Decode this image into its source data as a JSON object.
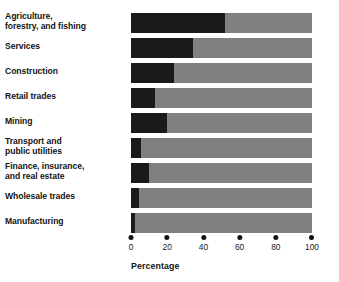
{
  "chart_data": {
    "type": "bar",
    "orientation": "horizontal",
    "stacked": true,
    "title": "",
    "subtitle": "",
    "xlabel": "Percentage",
    "ylabel": "",
    "xlim": [
      0,
      100
    ],
    "xticks": [
      0,
      20,
      40,
      60,
      80,
      100
    ],
    "xtick_labels": [
      "0",
      "20",
      "40",
      "60",
      "80",
      "100"
    ],
    "grid": false,
    "legend": "none",
    "colors": {
      "segment_dark": "#1a1a1a",
      "segment_gray": "#808080",
      "text": "#141414",
      "background": "#ffffff"
    },
    "categories": [
      "Agriculture,\nforestry, and fishing",
      "Services",
      "Construction",
      "Retail trades",
      "Mining",
      "Transport and\npublic utilities",
      "Finance, insurance,\nand real estate",
      "Wholesale trades",
      "Manufacturing"
    ],
    "series": [
      {
        "name": "dark segment",
        "color": "#1a1a1a",
        "values": [
          52,
          34,
          24,
          13,
          20,
          5.5,
          10,
          4.5,
          2
        ]
      },
      {
        "name": "gray segment",
        "color": "#808080",
        "values": [
          48,
          66,
          76,
          87,
          80,
          94.5,
          90,
          95.5,
          98
        ]
      }
    ],
    "rows": [
      {
        "label": "Agriculture,\nforestry, and fishing",
        "dark": 52,
        "gray": 48,
        "two_line": true
      },
      {
        "label": "Services",
        "dark": 34,
        "gray": 66,
        "two_line": false
      },
      {
        "label": "Construction",
        "dark": 24,
        "gray": 76,
        "two_line": false
      },
      {
        "label": "Retail trades",
        "dark": 13,
        "gray": 87,
        "two_line": false
      },
      {
        "label": "Mining",
        "dark": 20,
        "gray": 80,
        "two_line": false
      },
      {
        "label": "Transport and\npublic utilities",
        "dark": 5.5,
        "gray": 94.5,
        "two_line": true
      },
      {
        "label": "Finance, insurance,\nand real estate",
        "dark": 10,
        "gray": 90,
        "two_line": true
      },
      {
        "label": "Wholesale trades",
        "dark": 4.5,
        "gray": 95.5,
        "two_line": false
      },
      {
        "label": "Manufacturing",
        "dark": 2,
        "gray": 98,
        "two_line": false
      }
    ]
  },
  "axis": {
    "title": "Percentage",
    "ticks": [
      "0",
      "20",
      "40",
      "60",
      "80",
      "100"
    ]
  }
}
